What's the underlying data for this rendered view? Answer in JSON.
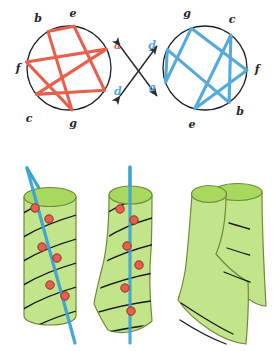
{
  "figure": {
    "canvas": {
      "width": 274,
      "height": 351
    }
  },
  "colors": {
    "red": "#e8604c",
    "blue": "#54a9dd",
    "circle_stroke": "#1d1f24",
    "label_dark": "#22252b",
    "green_body": "#c2e58c",
    "green_top": "#a9d85f",
    "green_edge": "#6f8a3a",
    "dot_fill": "#e8604c",
    "dot_stroke": "#8c3325",
    "helix_line": "#1a1a1a",
    "arrow": "#2a2c31"
  },
  "left_circle": {
    "name": "red-heptagram",
    "color": "#e8604c",
    "center": {
      "cx": 69,
      "cy": 68
    },
    "radius": 42,
    "nodes": [
      {
        "id": "e",
        "label": "e",
        "angle_deg": -83,
        "label_color": "dark"
      },
      {
        "id": "a",
        "label": "a",
        "angle_deg": -27,
        "label_color": "red"
      },
      {
        "id": "d",
        "label": "d",
        "angle_deg": 32,
        "label_color": "blue"
      },
      {
        "id": "g",
        "label": "g",
        "angle_deg": 86,
        "label_color": "dark"
      },
      {
        "id": "c",
        "label": "c",
        "angle_deg": 141,
        "label_color": "dark"
      },
      {
        "id": "f",
        "label": "f",
        "angle_deg": 188,
        "label_color": "dark"
      },
      {
        "id": "b",
        "label": "b",
        "angle_deg": 240,
        "label_color": "dark"
      }
    ],
    "chord_order": [
      "e",
      "d",
      "c",
      "a",
      "f",
      "g",
      "b",
      "e"
    ]
  },
  "right_circle": {
    "name": "blue-heptagram",
    "color": "#54a9dd",
    "center": {
      "cx": 205,
      "cy": 68
    },
    "radius": 42,
    "nodes": [
      {
        "id": "g",
        "label": "g",
        "angle_deg": -109,
        "label_color": "dark"
      },
      {
        "id": "c",
        "label": "c",
        "angle_deg": -52,
        "label_color": "dark"
      },
      {
        "id": "f",
        "label": "f",
        "angle_deg": 3,
        "label_color": "dark"
      },
      {
        "id": "b",
        "label": "b",
        "angle_deg": 55,
        "label_color": "dark"
      },
      {
        "id": "e",
        "label": "e",
        "angle_deg": 104,
        "label_color": "dark"
      },
      {
        "id": "a",
        "label": "a",
        "angle_deg": 160,
        "label_color": "blue"
      },
      {
        "id": "d",
        "label": "d",
        "angle_deg": 206,
        "label_color": "blue"
      }
    ],
    "chord_order": [
      "g",
      "f",
      "e",
      "c",
      "b",
      "d",
      "a",
      "g"
    ]
  },
  "arrows": {
    "name": "crossed-double-arrows",
    "count": 2,
    "items": [
      {
        "id": "arrow-up-right",
        "from": {
          "x": 117,
          "y": 95
        },
        "to": {
          "x": 158,
          "y": 48
        }
      },
      {
        "id": "arrow-down-right",
        "from": {
          "x": 117,
          "y": 48
        },
        "to": {
          "x": 158,
          "y": 95
        }
      }
    ]
  },
  "cylinders": [
    {
      "id": "cylinder-straight",
      "label": "straight cylinder with straight intersecting line",
      "line_color": "#3ba3d8",
      "line_straight": true,
      "dot_count": 6,
      "helix_stripe_count": 6
    },
    {
      "id": "cylinder-bent",
      "label": "bent cylinder with straight intersecting line",
      "line_color": "#3ba3d8",
      "line_straight": true,
      "dot_count": 6,
      "helix_stripe_count": 6
    },
    {
      "id": "cylinder-folded",
      "label": "folded cylinder, no intersecting line",
      "line_color": null,
      "line_straight": false,
      "dot_count": 0,
      "helix_stripe_count": 3
    }
  ]
}
